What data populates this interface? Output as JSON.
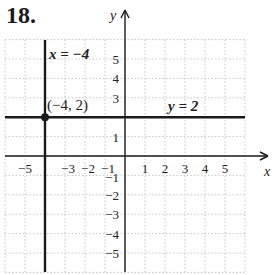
{
  "problem": {
    "number": "18."
  },
  "chart_data": {
    "type": "line",
    "title": "",
    "xlabel": "x",
    "ylabel": "y",
    "xlim": [
      -6,
      6
    ],
    "ylim": [
      -6,
      6
    ],
    "grid": true,
    "x_ticks": [
      -5,
      -3,
      -2,
      -1,
      1,
      2,
      3,
      4,
      5
    ],
    "x_tick_labels": [
      "−5",
      "−3",
      "−2",
      "−1",
      "1",
      "2",
      "3",
      "4",
      "5"
    ],
    "y_ticks": [
      5,
      4,
      3,
      1,
      -1,
      -2,
      -3,
      -4,
      -5
    ],
    "y_tick_labels": [
      "5",
      "4",
      "3",
      "1",
      "−1",
      "−2",
      "−3",
      "−4",
      "−5"
    ],
    "series": [
      {
        "name": "x = −4",
        "kind": "vertical-line",
        "x": -4,
        "label": "x = −4"
      },
      {
        "name": "y = 2",
        "kind": "horizontal-line",
        "y": 2,
        "label": "y = 2"
      }
    ],
    "points": [
      {
        "x": -4,
        "y": 2,
        "label": "(−4, 2)"
      }
    ],
    "axis_labels": {
      "x": "x",
      "y": "y"
    }
  },
  "labels": {
    "vertical_line": "x = −4",
    "horizontal_line": "y = 2",
    "point": "(−4, 2)",
    "x_axis": "x",
    "y_axis": "y"
  },
  "colors": {
    "line": "#1a1a1a",
    "grid": "#bfbfbf",
    "background": "#ffffff"
  }
}
